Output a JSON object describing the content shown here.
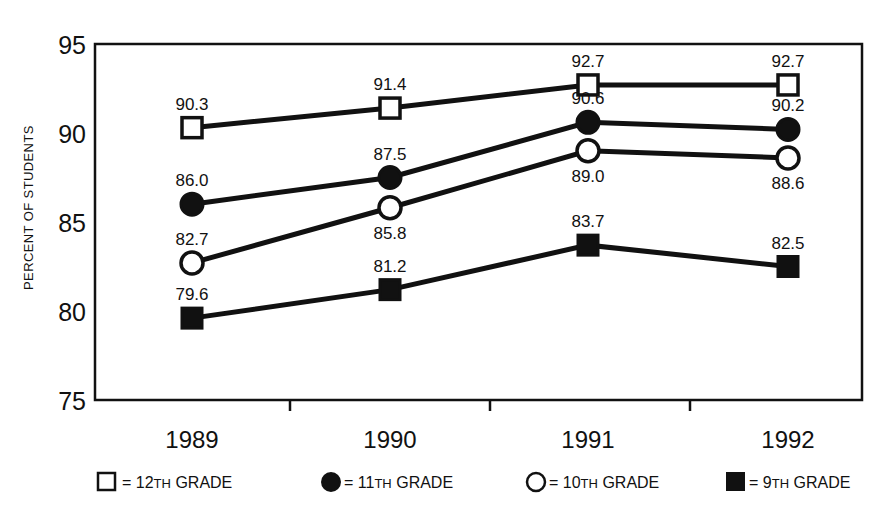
{
  "chart_data": {
    "type": "line",
    "title": "",
    "xlabel": "",
    "ylabel": "PERCENT OF STUDENTS",
    "categories": [
      "1989",
      "1990",
      "1991",
      "1992"
    ],
    "ylim": [
      75,
      95
    ],
    "yticks": [
      "75",
      "80",
      "85",
      "90",
      "95"
    ],
    "grid": false,
    "legend_position": "bottom",
    "series": [
      {
        "name": "12TH GRADE",
        "marker": "open-square",
        "values": [
          90.3,
          91.4,
          92.7,
          92.7
        ],
        "labels": [
          "90.3",
          "91.4",
          "92.7",
          "92.7"
        ],
        "label_positions": [
          "above",
          "above",
          "above",
          "above"
        ]
      },
      {
        "name": "11TH GRADE",
        "marker": "filled-circle",
        "values": [
          86.0,
          87.5,
          90.6,
          90.2
        ],
        "labels": [
          "86.0",
          "87.5",
          "90.6",
          "90.2"
        ],
        "label_positions": [
          "above",
          "above",
          "above",
          "above"
        ]
      },
      {
        "name": "10TH GRADE",
        "marker": "open-circle",
        "values": [
          82.7,
          85.8,
          89.0,
          88.6
        ],
        "labels": [
          "82.7",
          "85.8",
          "89.0",
          "88.6"
        ],
        "label_positions": [
          "above",
          "below",
          "below",
          "below"
        ]
      },
      {
        "name": "9TH GRADE",
        "marker": "filled-square",
        "values": [
          79.6,
          81.2,
          83.7,
          82.5
        ],
        "labels": [
          "79.6",
          "81.2",
          "83.7",
          "82.5"
        ],
        "label_positions": [
          "above",
          "above",
          "above",
          "above"
        ]
      }
    ]
  },
  "axis": {
    "y_title": "PERCENT OF STUDENTS",
    "y_ticks": [
      "95",
      "90",
      "85",
      "80",
      "75"
    ],
    "x_ticks": [
      "1989",
      "1990",
      "1991",
      "1992"
    ]
  },
  "legend": {
    "items": [
      {
        "marker": "open-square",
        "equals": "=",
        "grade_number": "12",
        "grade_suffix": "TH",
        "grade_word": "GRADE",
        "full": "= 12TH GRADE"
      },
      {
        "marker": "filled-circle",
        "equals": "=",
        "grade_number": "11",
        "grade_suffix": "TH",
        "grade_word": "GRADE",
        "full": "= 11TH GRADE"
      },
      {
        "marker": "open-circle",
        "equals": "=",
        "grade_number": "10",
        "grade_suffix": "TH",
        "grade_word": "GRADE",
        "full": "= 10TH GRADE"
      },
      {
        "marker": "filled-square",
        "equals": "=",
        "grade_number": "9",
        "grade_suffix": "TH",
        "grade_word": "GRADE",
        "full": "= 9TH GRADE"
      }
    ]
  },
  "colors": {
    "ink": "#111111",
    "background": "#ffffff",
    "marker_fill_open": "#ffffff",
    "marker_fill_solid": "#111111"
  }
}
